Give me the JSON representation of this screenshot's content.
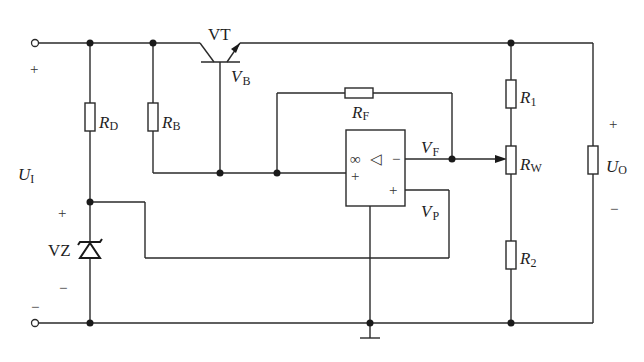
{
  "diagram": {
    "components": {
      "transistor": {
        "label": "VT"
      },
      "base_node": {
        "label_main": "V",
        "label_sub": "B"
      },
      "resistor_rd": {
        "label_main": "R",
        "label_sub": "D"
      },
      "resistor_rb": {
        "label_main": "R",
        "label_sub": "B"
      },
      "resistor_rf": {
        "label_main": "R",
        "label_sub": "F"
      },
      "resistor_r1": {
        "label_main": "R",
        "label_sub": "1"
      },
      "potentiometer_rw": {
        "label_main": "R",
        "label_sub": "W"
      },
      "resistor_r2": {
        "label_main": "R",
        "label_sub": "2"
      },
      "zener": {
        "label": "VZ"
      },
      "opamp": {
        "infinity": "∞",
        "triangle": "◁",
        "minus_out": "−",
        "plus_in": "+",
        "plus_ref": "+"
      },
      "node_vf": {
        "label_main": "V",
        "label_sub": "F"
      },
      "node_vp": {
        "label_main": "V",
        "label_sub": "P"
      }
    },
    "input": {
      "label_main": "U",
      "label_sub": "I",
      "plus": "+",
      "minus": "−"
    },
    "output": {
      "label_main": "U",
      "label_sub": "O",
      "plus": "+",
      "minus": "−"
    },
    "zener_polarity": {
      "plus": "+",
      "minus": "−"
    }
  }
}
